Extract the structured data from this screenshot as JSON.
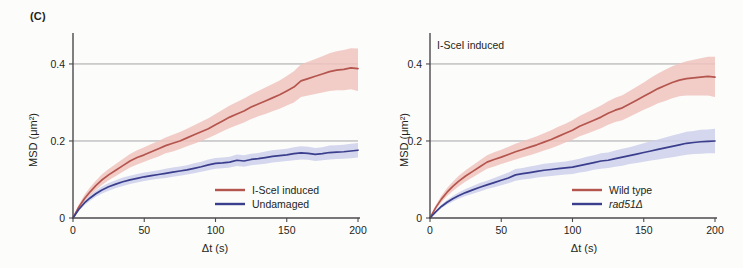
{
  "figure": {
    "panel_label": "(C)",
    "background_color": "#fcfcfb"
  },
  "colors": {
    "red": "#b4554e",
    "red_band": "#f0c3bd",
    "blue": "#3a3e8c",
    "blue_band": "#cdd0ea",
    "axis": "#4c4a4c",
    "grid": "#8e8d90"
  },
  "left_panel": {
    "annotation": "",
    "axis": {
      "x_title": "Δt (s)",
      "y_title": "MSD (μm²)",
      "x_ticks": [
        "0",
        "50",
        "100",
        "150",
        "200"
      ],
      "y_ticks": [
        "0",
        "0.2",
        "0.4"
      ]
    },
    "legend": [
      {
        "label": "I-SceI induced",
        "color": "#b4554e",
        "italic": false
      },
      {
        "label": "Undamaged",
        "color": "#3a3e8c",
        "italic": false
      }
    ]
  },
  "right_panel": {
    "annotation": "I-SceI induced",
    "axis": {
      "x_title": "Δt (s)",
      "y_title": "MSD (μm²)",
      "x_ticks": [
        "0",
        "50",
        "100",
        "150",
        "200"
      ],
      "y_ticks": [
        "0",
        "0.2",
        "0.4"
      ]
    },
    "legend": [
      {
        "label": "Wild type",
        "color": "#b4554e",
        "italic": false
      },
      {
        "label": "rad51Δ",
        "color": "#3a3e8c",
        "italic": true
      }
    ]
  },
  "chart_data": [
    {
      "type": "line",
      "panel": "left",
      "title": "(C) left",
      "xlabel": "Δt (s)",
      "ylabel": "MSD (μm²)",
      "xlim": [
        0,
        200
      ],
      "ylim": [
        0,
        0.47
      ],
      "grid": "horizontal gridlines at 0.2 and 0.4",
      "legend_position": "lower-right inside axes",
      "x": [
        0,
        4,
        8,
        12,
        16,
        20,
        25,
        30,
        35,
        40,
        45,
        50,
        55,
        60,
        65,
        70,
        75,
        80,
        85,
        90,
        95,
        100,
        105,
        110,
        115,
        120,
        125,
        130,
        135,
        140,
        145,
        150,
        155,
        160,
        165,
        170,
        175,
        180,
        185,
        190,
        195,
        200
      ],
      "series": [
        {
          "name": "I-SceI induced",
          "color": "#b4554e",
          "values": [
            0,
            0.028,
            0.05,
            0.068,
            0.084,
            0.098,
            0.112,
            0.124,
            0.136,
            0.148,
            0.157,
            0.164,
            0.172,
            0.18,
            0.188,
            0.194,
            0.2,
            0.208,
            0.216,
            0.224,
            0.232,
            0.242,
            0.252,
            0.262,
            0.27,
            0.278,
            0.288,
            0.296,
            0.304,
            0.312,
            0.32,
            0.33,
            0.34,
            0.356,
            0.362,
            0.368,
            0.374,
            0.38,
            0.384,
            0.386,
            0.39,
            0.388
          ],
          "band_lower": [
            0,
            0.023,
            0.042,
            0.058,
            0.072,
            0.085,
            0.098,
            0.109,
            0.12,
            0.131,
            0.139,
            0.146,
            0.153,
            0.16,
            0.168,
            0.173,
            0.179,
            0.186,
            0.193,
            0.2,
            0.208,
            0.216,
            0.225,
            0.234,
            0.241,
            0.248,
            0.257,
            0.264,
            0.27,
            0.277,
            0.284,
            0.292,
            0.3,
            0.314,
            0.318,
            0.322,
            0.326,
            0.33,
            0.332,
            0.332,
            0.334,
            0.33
          ],
          "band_upper": [
            0,
            0.034,
            0.06,
            0.08,
            0.097,
            0.112,
            0.127,
            0.14,
            0.153,
            0.166,
            0.176,
            0.184,
            0.192,
            0.2,
            0.209,
            0.216,
            0.223,
            0.232,
            0.241,
            0.25,
            0.259,
            0.27,
            0.281,
            0.292,
            0.301,
            0.31,
            0.321,
            0.33,
            0.339,
            0.348,
            0.357,
            0.369,
            0.381,
            0.399,
            0.406,
            0.413,
            0.42,
            0.428,
            0.433,
            0.436,
            0.441,
            0.44
          ]
        },
        {
          "name": "Undamaged",
          "color": "#3a3e8c",
          "values": [
            0,
            0.022,
            0.039,
            0.052,
            0.063,
            0.072,
            0.081,
            0.088,
            0.094,
            0.099,
            0.103,
            0.107,
            0.11,
            0.113,
            0.116,
            0.119,
            0.122,
            0.125,
            0.129,
            0.133,
            0.138,
            0.142,
            0.143,
            0.145,
            0.15,
            0.148,
            0.152,
            0.154,
            0.157,
            0.16,
            0.162,
            0.164,
            0.167,
            0.169,
            0.168,
            0.165,
            0.167,
            0.17,
            0.171,
            0.172,
            0.174,
            0.176
          ],
          "band_lower": [
            0,
            0.018,
            0.033,
            0.045,
            0.055,
            0.063,
            0.071,
            0.078,
            0.083,
            0.088,
            0.092,
            0.096,
            0.099,
            0.102,
            0.104,
            0.107,
            0.11,
            0.113,
            0.116,
            0.12,
            0.124,
            0.128,
            0.129,
            0.131,
            0.135,
            0.133,
            0.137,
            0.139,
            0.141,
            0.144,
            0.146,
            0.148,
            0.15,
            0.152,
            0.151,
            0.148,
            0.15,
            0.152,
            0.153,
            0.154,
            0.155,
            0.157
          ],
          "band_upper": [
            0,
            0.026,
            0.045,
            0.059,
            0.071,
            0.081,
            0.091,
            0.098,
            0.105,
            0.11,
            0.114,
            0.118,
            0.121,
            0.124,
            0.128,
            0.131,
            0.134,
            0.137,
            0.142,
            0.146,
            0.152,
            0.156,
            0.157,
            0.159,
            0.165,
            0.163,
            0.167,
            0.169,
            0.173,
            0.176,
            0.178,
            0.18,
            0.184,
            0.186,
            0.185,
            0.182,
            0.184,
            0.188,
            0.189,
            0.19,
            0.193,
            0.195
          ]
        }
      ]
    },
    {
      "type": "line",
      "panel": "right",
      "title": "I-SceI induced",
      "xlabel": "Δt (s)",
      "ylabel": "MSD (μm²)",
      "xlim": [
        0,
        200
      ],
      "ylim": [
        0,
        0.47
      ],
      "grid": "horizontal gridlines at 0.2 and 0.4",
      "legend_position": "lower-right inside axes",
      "x": [
        0,
        4,
        8,
        12,
        16,
        20,
        25,
        30,
        35,
        40,
        45,
        50,
        55,
        60,
        65,
        70,
        75,
        80,
        85,
        90,
        95,
        100,
        105,
        110,
        115,
        120,
        125,
        130,
        135,
        140,
        145,
        150,
        155,
        160,
        165,
        170,
        175,
        180,
        185,
        190,
        195,
        200
      ],
      "series": [
        {
          "name": "Wild type",
          "color": "#b4554e",
          "values": [
            0,
            0.027,
            0.049,
            0.067,
            0.082,
            0.095,
            0.109,
            0.121,
            0.133,
            0.145,
            0.152,
            0.158,
            0.165,
            0.172,
            0.178,
            0.184,
            0.19,
            0.197,
            0.204,
            0.212,
            0.22,
            0.228,
            0.238,
            0.246,
            0.254,
            0.262,
            0.272,
            0.28,
            0.286,
            0.296,
            0.306,
            0.316,
            0.326,
            0.336,
            0.344,
            0.352,
            0.358,
            0.362,
            0.364,
            0.366,
            0.368,
            0.366
          ],
          "band_lower": [
            0,
            0.022,
            0.041,
            0.057,
            0.07,
            0.082,
            0.095,
            0.106,
            0.117,
            0.128,
            0.134,
            0.14,
            0.146,
            0.152,
            0.158,
            0.163,
            0.169,
            0.175,
            0.181,
            0.188,
            0.196,
            0.203,
            0.212,
            0.219,
            0.226,
            0.233,
            0.242,
            0.249,
            0.254,
            0.263,
            0.272,
            0.281,
            0.289,
            0.298,
            0.304,
            0.311,
            0.316,
            0.318,
            0.318,
            0.318,
            0.318,
            0.314
          ],
          "band_upper": [
            0,
            0.033,
            0.058,
            0.078,
            0.094,
            0.109,
            0.124,
            0.137,
            0.15,
            0.163,
            0.171,
            0.177,
            0.185,
            0.193,
            0.199,
            0.206,
            0.212,
            0.22,
            0.228,
            0.237,
            0.245,
            0.254,
            0.265,
            0.274,
            0.283,
            0.292,
            0.303,
            0.312,
            0.319,
            0.33,
            0.341,
            0.352,
            0.364,
            0.375,
            0.385,
            0.394,
            0.401,
            0.407,
            0.411,
            0.415,
            0.419,
            0.419
          ]
        },
        {
          "name": "rad51Δ",
          "color": "#3a3e8c",
          "values": [
            0,
            0.016,
            0.03,
            0.041,
            0.05,
            0.058,
            0.066,
            0.073,
            0.08,
            0.086,
            0.092,
            0.098,
            0.104,
            0.112,
            0.115,
            0.118,
            0.121,
            0.124,
            0.126,
            0.128,
            0.13,
            0.132,
            0.136,
            0.14,
            0.144,
            0.148,
            0.15,
            0.154,
            0.158,
            0.162,
            0.166,
            0.17,
            0.174,
            0.178,
            0.182,
            0.186,
            0.19,
            0.194,
            0.196,
            0.198,
            0.199,
            0.2
          ],
          "band_lower": [
            0,
            0.013,
            0.025,
            0.035,
            0.043,
            0.05,
            0.057,
            0.063,
            0.069,
            0.075,
            0.08,
            0.085,
            0.09,
            0.097,
            0.1,
            0.102,
            0.105,
            0.107,
            0.109,
            0.111,
            0.113,
            0.114,
            0.118,
            0.121,
            0.125,
            0.128,
            0.13,
            0.133,
            0.136,
            0.14,
            0.143,
            0.146,
            0.149,
            0.152,
            0.155,
            0.158,
            0.161,
            0.164,
            0.166,
            0.167,
            0.168,
            0.168
          ],
          "band_upper": [
            0,
            0.019,
            0.035,
            0.047,
            0.057,
            0.066,
            0.075,
            0.083,
            0.091,
            0.097,
            0.104,
            0.111,
            0.118,
            0.127,
            0.13,
            0.134,
            0.137,
            0.141,
            0.143,
            0.145,
            0.147,
            0.15,
            0.154,
            0.159,
            0.163,
            0.168,
            0.17,
            0.175,
            0.18,
            0.184,
            0.189,
            0.194,
            0.199,
            0.204,
            0.209,
            0.214,
            0.219,
            0.224,
            0.226,
            0.229,
            0.23,
            0.232
          ]
        }
      ]
    }
  ]
}
